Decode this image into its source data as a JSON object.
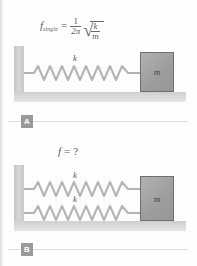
{
  "figure": {
    "title_caption": "",
    "panels": [
      {
        "id": "A",
        "badge_label": "A",
        "formula": {
          "lhs_symbol": "f",
          "lhs_subscript": "single",
          "equals": "=",
          "fraction_numerator": "1",
          "fraction_denominator": "2π",
          "radical_glyph": "√",
          "radicand_numerator": "k",
          "radicand_denominator": "m",
          "plain_text": "f_single = (1/2π)√(k/m)"
        },
        "springs": [
          {
            "stiffness_label": "k",
            "coil_count": 11
          }
        ],
        "mass_label": "m",
        "wall_present": true,
        "floor_present": true
      },
      {
        "id": "B",
        "badge_label": "B",
        "formula": {
          "lhs_symbol": "f",
          "equals": "=",
          "unknown": "?",
          "plain_text": "f = ?"
        },
        "springs": [
          {
            "stiffness_label": "k",
            "coil_count": 11
          },
          {
            "stiffness_label": "k",
            "coil_count": 11
          }
        ],
        "mass_label": "m",
        "wall_present": true,
        "floor_present": true
      }
    ]
  },
  "colors": {
    "page_background": "#fefefe",
    "wall_fill": "#cfcfcf",
    "floor_fill": "#d8d8d8",
    "block_fill": "#a5a5a5",
    "block_border": "#6e6e6e",
    "spring_stroke": "#b0b0b0",
    "text_gray": "#5a5a5a",
    "badge_fill": "#9a9a9a",
    "badge_text": "#ffffff",
    "rule_line": "#dcdcdc"
  }
}
